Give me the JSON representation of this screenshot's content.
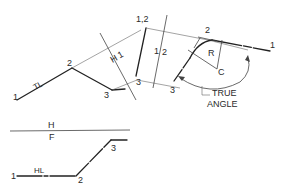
{
  "diagram": {
    "labels": {
      "tl": "TL",
      "hl": "HL",
      "h_upper": "H",
      "f_lower": "F",
      "h1_fold": "H",
      "h1_fold_num": "1",
      "fold_1": "1",
      "fold_2": "2",
      "radius": "R",
      "center": "C",
      "true_angle_line1": "TRUE",
      "true_angle_line2": "ANGLE"
    },
    "points": {
      "top_view": {
        "p1": "1",
        "p2": "2",
        "p3": "3"
      },
      "aux1_view": {
        "p12": "1,2",
        "p3": "3"
      },
      "aux2_view": {
        "p1": "1",
        "p2": "2",
        "p3": "3"
      },
      "front_view": {
        "p1": "1",
        "p2": "2",
        "p3": "3"
      }
    },
    "colors": {
      "line": "#222222",
      "projection": "#777777",
      "text": "#2a2a2a",
      "background": "#ffffff"
    }
  }
}
